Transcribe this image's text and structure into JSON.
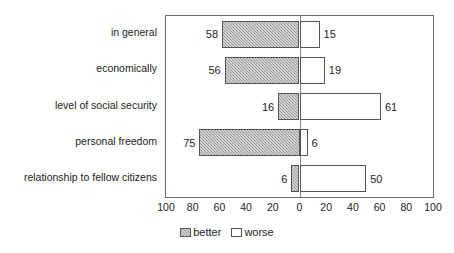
{
  "chart_data": {
    "type": "bar",
    "orientation": "horizontal",
    "layout": "diverging",
    "title": "",
    "subtitle": "",
    "xlabel": "",
    "ylabel": "",
    "categories": [
      "in general",
      "economically",
      "level of social security",
      "personal freedom",
      "relationship to fellow citizens"
    ],
    "series": [
      {
        "name": "better",
        "direction": "left",
        "values": [
          58,
          56,
          16,
          75,
          6
        ]
      },
      {
        "name": "worse",
        "direction": "right",
        "values": [
          15,
          19,
          61,
          6,
          50
        ]
      }
    ],
    "xlim": [
      -100,
      100
    ],
    "xticks": [
      -100,
      -80,
      -60,
      -40,
      -20,
      0,
      20,
      40,
      60,
      80,
      100
    ],
    "xtick_labels": [
      "100",
      "80",
      "60",
      "40",
      "20",
      "0",
      "20",
      "40",
      "60",
      "80",
      "100"
    ],
    "grid": false,
    "legend_position": "bottom-center",
    "legend": [
      {
        "label": "better",
        "swatch": "hatched-gray"
      },
      {
        "label": "worse",
        "swatch": "white-outline"
      }
    ],
    "data_labels": {
      "better": [
        "58",
        "56",
        "16",
        "75",
        "6"
      ],
      "worse": [
        "15",
        "19",
        "61",
        "6",
        "50"
      ]
    },
    "colors": {
      "better_fill": "#9a9a9a",
      "worse_fill": "#ffffff",
      "bar_border": "#555555",
      "frame": "#6f6f6f",
      "axis_line": "#8a8a8a",
      "text": "#1d1d1d",
      "background": "#ffffff"
    }
  }
}
